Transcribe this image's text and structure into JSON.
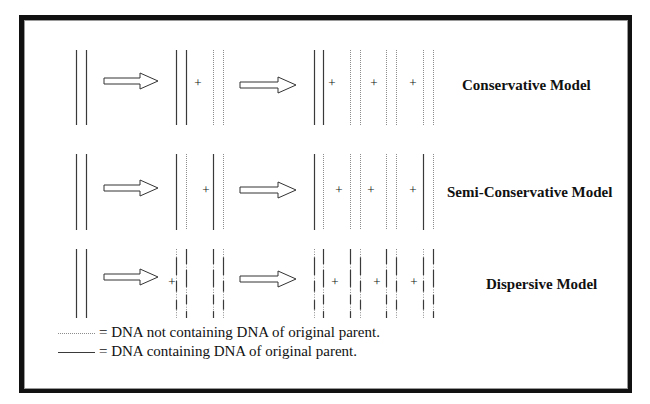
{
  "diagram": {
    "colors": {
      "solid_strand": "#3a3a3a",
      "new_strand": "#8c8c8c",
      "arrow_stroke": "#333333",
      "frame": "#111111",
      "frame_inner": "#9a9a9a",
      "text": "#111111"
    },
    "strand_types": {
      "solid": "DNA containing DNA of original parent",
      "dotted": "DNA not containing DNA of original parent",
      "mixed": "Dispersed segments of parental and new DNA"
    },
    "models": [
      {
        "label": "Conservative Model",
        "label_x": 462,
        "label_y": 78,
        "y_top": 50,
        "y_bottom": 125,
        "arrows": [
          {
            "x1": 104,
            "x2": 158,
            "y": 81
          },
          {
            "x1": 240,
            "x2": 296,
            "y": 85
          }
        ],
        "strands": [
          {
            "x": 76,
            "type": "solid"
          },
          {
            "x": 86,
            "type": "solid"
          },
          {
            "x": 176,
            "type": "solid"
          },
          {
            "x": 186,
            "type": "solid"
          },
          {
            "x": 213,
            "type": "dotted"
          },
          {
            "x": 223,
            "type": "dotted"
          },
          {
            "x": 314,
            "type": "solid"
          },
          {
            "x": 323,
            "type": "solid"
          },
          {
            "x": 350,
            "type": "dotted"
          },
          {
            "x": 360,
            "type": "dotted"
          },
          {
            "x": 386,
            "type": "dotted"
          },
          {
            "x": 396,
            "type": "dotted"
          },
          {
            "x": 423,
            "type": "dotted"
          },
          {
            "x": 433,
            "type": "dotted"
          }
        ],
        "plus_signs": [
          {
            "x": 198,
            "y": 87
          },
          {
            "x": 332,
            "y": 87
          },
          {
            "x": 374,
            "y": 87
          },
          {
            "x": 413,
            "y": 87
          }
        ]
      },
      {
        "label": "Semi-Conservative Model",
        "label_x": 447,
        "label_y": 185,
        "y_top": 154,
        "y_bottom": 230,
        "arrows": [
          {
            "x1": 104,
            "x2": 158,
            "y": 188
          },
          {
            "x1": 240,
            "x2": 296,
            "y": 190
          }
        ],
        "strands": [
          {
            "x": 76,
            "type": "solid"
          },
          {
            "x": 86,
            "type": "solid"
          },
          {
            "x": 176,
            "type": "solid"
          },
          {
            "x": 186,
            "type": "dotted"
          },
          {
            "x": 213,
            "type": "solid"
          },
          {
            "x": 223,
            "type": "dotted"
          },
          {
            "x": 314,
            "type": "solid"
          },
          {
            "x": 323,
            "type": "dotted"
          },
          {
            "x": 350,
            "type": "dotted"
          },
          {
            "x": 360,
            "type": "dotted"
          },
          {
            "x": 386,
            "type": "dotted"
          },
          {
            "x": 396,
            "type": "dotted"
          },
          {
            "x": 423,
            "type": "solid"
          },
          {
            "x": 433,
            "type": "dotted"
          }
        ],
        "plus_signs": [
          {
            "x": 206,
            "y": 194
          },
          {
            "x": 339,
            "y": 194
          },
          {
            "x": 371,
            "y": 194
          },
          {
            "x": 413,
            "y": 194
          }
        ]
      },
      {
        "label": "Dispersive Model",
        "label_x": 486,
        "label_y": 277,
        "y_top": 249,
        "y_bottom": 318,
        "arrows": [
          {
            "x1": 104,
            "x2": 158,
            "y": 277
          },
          {
            "x1": 240,
            "x2": 296,
            "y": 279
          }
        ],
        "strands": [
          {
            "x": 76,
            "type": "solid"
          },
          {
            "x": 86,
            "type": "solid"
          },
          {
            "x": 176,
            "type": "mixedA"
          },
          {
            "x": 186,
            "type": "mixedB"
          },
          {
            "x": 213,
            "type": "mixedB"
          },
          {
            "x": 223,
            "type": "mixedA"
          },
          {
            "x": 314,
            "type": "mixedA"
          },
          {
            "x": 323,
            "type": "mixedB"
          },
          {
            "x": 350,
            "type": "mixedB"
          },
          {
            "x": 360,
            "type": "mixedA"
          },
          {
            "x": 386,
            "type": "mixedB"
          },
          {
            "x": 396,
            "type": "mixedA"
          },
          {
            "x": 423,
            "type": "mixedA"
          },
          {
            "x": 433,
            "type": "mixedB"
          }
        ],
        "plus_signs": [
          {
            "x": 172,
            "y": 286
          },
          {
            "x": 335,
            "y": 286
          },
          {
            "x": 377,
            "y": 286
          },
          {
            "x": 414,
            "y": 286
          }
        ]
      }
    ],
    "legend": [
      {
        "line_type": "dotted",
        "text": "= DNA not containing DNA of original parent.",
        "line_x1": 58,
        "line_x2": 95,
        "line_y": 333,
        "text_x": 99,
        "text_y": 325
      },
      {
        "line_type": "solid",
        "text": "= DNA containing DNA of original parent.",
        "line_x1": 58,
        "line_x2": 95,
        "line_y": 352,
        "text_x": 99,
        "text_y": 344
      }
    ]
  }
}
